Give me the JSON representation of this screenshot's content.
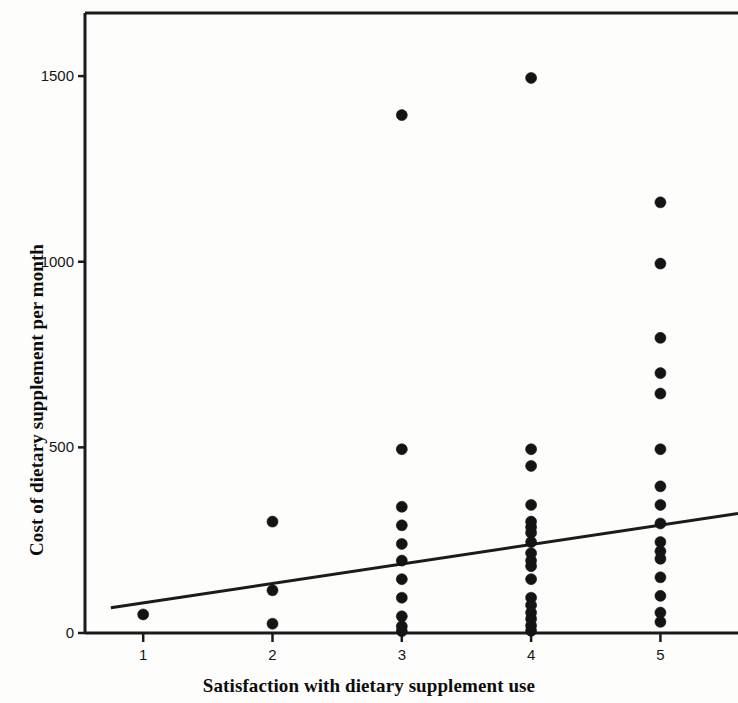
{
  "chart_data": {
    "type": "scatter",
    "title": "",
    "subtitle": "",
    "xlabel": "Satisfaction with dietary supplement use",
    "ylabel": "Cost of dietary supplement per month",
    "xlim": [
      0.55,
      5.6
    ],
    "ylim": [
      0,
      1670
    ],
    "xticks": [
      1,
      2,
      3,
      4,
      5
    ],
    "xtick_labels": [
      "1",
      "2",
      "3",
      "4",
      "5"
    ],
    "yticks": [
      0,
      500,
      1000,
      1500
    ],
    "ytick_labels": [
      "0",
      "500",
      "1000",
      "1500"
    ],
    "grid": false,
    "legend": null,
    "marker": {
      "shape": "circle",
      "color": "#141414",
      "size_px": 11
    },
    "series": [
      {
        "name": "Respondents",
        "points": [
          {
            "x": 1,
            "y": 50
          },
          {
            "x": 2,
            "y": 300
          },
          {
            "x": 2,
            "y": 115
          },
          {
            "x": 2,
            "y": 25
          },
          {
            "x": 3,
            "y": 1395
          },
          {
            "x": 3,
            "y": 495
          },
          {
            "x": 3,
            "y": 340
          },
          {
            "x": 3,
            "y": 290
          },
          {
            "x": 3,
            "y": 240
          },
          {
            "x": 3,
            "y": 195
          },
          {
            "x": 3,
            "y": 145
          },
          {
            "x": 3,
            "y": 95
          },
          {
            "x": 3,
            "y": 45
          },
          {
            "x": 3,
            "y": 18
          },
          {
            "x": 3,
            "y": 5
          },
          {
            "x": 4,
            "y": 1495
          },
          {
            "x": 4,
            "y": 495
          },
          {
            "x": 4,
            "y": 450
          },
          {
            "x": 4,
            "y": 345
          },
          {
            "x": 4,
            "y": 300
          },
          {
            "x": 4,
            "y": 285
          },
          {
            "x": 4,
            "y": 270
          },
          {
            "x": 4,
            "y": 245
          },
          {
            "x": 4,
            "y": 215
          },
          {
            "x": 4,
            "y": 195
          },
          {
            "x": 4,
            "y": 180
          },
          {
            "x": 4,
            "y": 145
          },
          {
            "x": 4,
            "y": 95
          },
          {
            "x": 4,
            "y": 75
          },
          {
            "x": 4,
            "y": 55
          },
          {
            "x": 4,
            "y": 38
          },
          {
            "x": 4,
            "y": 20
          },
          {
            "x": 4,
            "y": 6
          },
          {
            "x": 5,
            "y": 1160
          },
          {
            "x": 5,
            "y": 995
          },
          {
            "x": 5,
            "y": 795
          },
          {
            "x": 5,
            "y": 700
          },
          {
            "x": 5,
            "y": 645
          },
          {
            "x": 5,
            "y": 495
          },
          {
            "x": 5,
            "y": 395
          },
          {
            "x": 5,
            "y": 345
          },
          {
            "x": 5,
            "y": 295
          },
          {
            "x": 5,
            "y": 245
          },
          {
            "x": 5,
            "y": 220
          },
          {
            "x": 5,
            "y": 200
          },
          {
            "x": 5,
            "y": 150
          },
          {
            "x": 5,
            "y": 100
          },
          {
            "x": 5,
            "y": 55
          },
          {
            "x": 5,
            "y": 30
          }
        ]
      }
    ],
    "fit_line": {
      "name": "linear fit",
      "x_start": 0.75,
      "y_start": 68,
      "x_end": 5.6,
      "y_end": 322,
      "color": "#1b1b1b",
      "width_px": 3
    },
    "frame": {
      "left_spine": true,
      "bottom_spine": true,
      "top_spine": true,
      "right_spine": false,
      "color": "#1b1b1b"
    }
  }
}
